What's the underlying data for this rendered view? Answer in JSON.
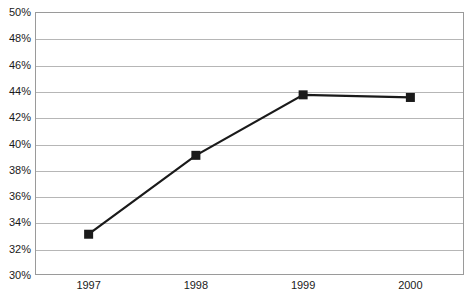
{
  "chart_data": {
    "type": "line",
    "title": "",
    "subtitle": "",
    "xlabel": "",
    "ylabel": "",
    "categories": [
      "1997",
      "1998",
      "1999",
      "2000"
    ],
    "values": [
      33.1,
      39.1,
      43.7,
      43.5
    ],
    "series": [
      {
        "name": "",
        "values": [
          33.1,
          39.1,
          43.7,
          43.5
        ]
      }
    ],
    "ylim": [
      30,
      50
    ],
    "ytick_step": 2,
    "ytick_labels": [
      "50%",
      "48%",
      "46%",
      "44%",
      "42%",
      "40%",
      "38%",
      "36%",
      "34%",
      "32%",
      "30%"
    ],
    "ytick_values": [
      50,
      48,
      46,
      44,
      42,
      40,
      38,
      36,
      34,
      32,
      30
    ],
    "xtick_labels": [
      "1997",
      "1998",
      "1999",
      "2000"
    ],
    "grid": true,
    "grid_axis": "y",
    "legend": false,
    "legend_position": "none",
    "marker": "square",
    "annotations": []
  },
  "style": {
    "line_color": "#1a1a1a",
    "marker_color": "#1a1a1a",
    "grid_color": "#b6b6b6",
    "frame_color": "#9a9a9a",
    "background": "#ffffff",
    "text_color": "#1a1a1a"
  }
}
